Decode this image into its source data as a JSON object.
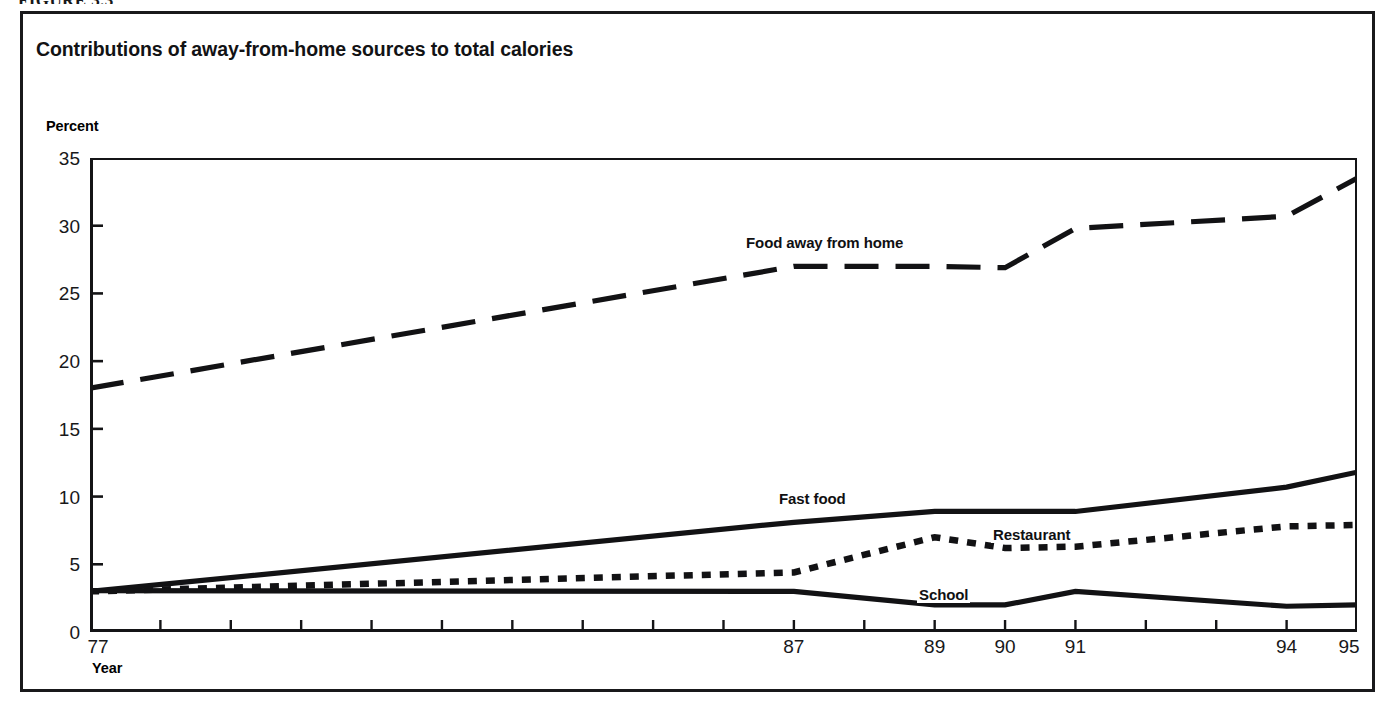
{
  "figure": {
    "caption": "FIGURE 3.3"
  },
  "chart_data": {
    "type": "line",
    "title": "Contributions of away-from-home sources to total calories",
    "xlabel": "Year",
    "ylabel": "Percent",
    "ylim": [
      0,
      35
    ],
    "yticks": [
      0,
      5,
      10,
      15,
      20,
      25,
      30,
      35
    ],
    "ytick_labels": [
      "0",
      "5",
      "10",
      "15",
      "20",
      "25",
      "30",
      "35"
    ],
    "xlim": [
      77,
      95
    ],
    "xticks": [
      77,
      78,
      79,
      80,
      81,
      82,
      83,
      84,
      85,
      86,
      87,
      88,
      89,
      90,
      91,
      92,
      93,
      94,
      95
    ],
    "xtick_labels_shown": [
      "77",
      "87",
      "89",
      "90",
      "91",
      "94",
      "95"
    ],
    "xtick_labels_shown_values": [
      77,
      87,
      89,
      90,
      91,
      94,
      95
    ],
    "grid": false,
    "legend_position": "inline-labels",
    "x": [
      77,
      87,
      89,
      90,
      91,
      94,
      95
    ],
    "series": [
      {
        "name": "Food away from home",
        "label": "Food away from home",
        "linestyle": "dashed",
        "color": "#121214",
        "values": [
          18.0,
          27.0,
          27.0,
          26.9,
          29.8,
          30.7,
          33.5
        ],
        "label_position": {
          "x": 744,
          "y": 234
        }
      },
      {
        "name": "Fast food",
        "label": "Fast food",
        "linestyle": "solid",
        "color": "#121214",
        "values": [
          3.0,
          8.1,
          8.9,
          8.9,
          8.9,
          10.7,
          11.8
        ],
        "label_position": {
          "x": 777,
          "y": 490
        }
      },
      {
        "name": "Restaurant",
        "label": "Restaurant",
        "linestyle": "dotted",
        "color": "#121214",
        "values": [
          3.0,
          4.4,
          7.0,
          6.2,
          6.3,
          7.8,
          7.9
        ],
        "label_position": {
          "x": 991,
          "y": 526
        }
      },
      {
        "name": "School",
        "label": "School",
        "linestyle": "solid",
        "color": "#121214",
        "values": [
          3.05,
          3.0,
          2.0,
          2.0,
          3.0,
          1.9,
          2.0
        ],
        "label_position": {
          "x": 917,
          "y": 586
        }
      }
    ]
  }
}
